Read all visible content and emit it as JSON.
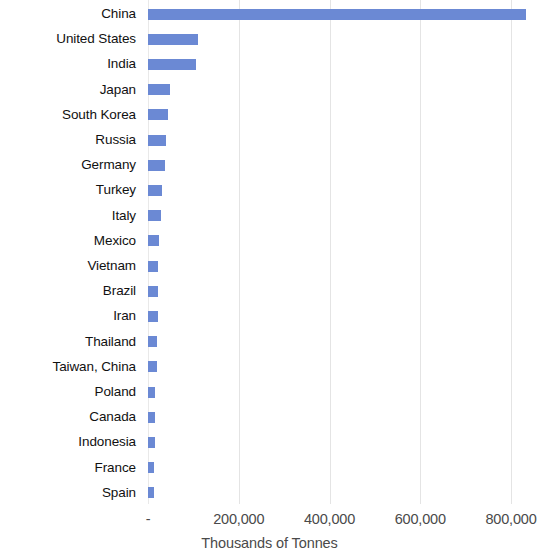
{
  "chart_data": {
    "type": "bar",
    "orientation": "horizontal",
    "title": "",
    "xlabel": "Thousands of Tonnes",
    "ylabel": "",
    "xlim": [
      0,
      840000
    ],
    "xticks": [
      0,
      200000,
      400000,
      600000,
      800000
    ],
    "xticklabels": [
      "-",
      "200,000",
      "400,000",
      "600,000",
      "800,000"
    ],
    "grid": "vertical",
    "legend": "none",
    "bar_color": "#6b89d4",
    "gridline_color": "#e4e4e4",
    "label_color": "#111111",
    "tick_color": "#4a4a4a",
    "categories": [
      "China",
      "United States",
      "India",
      "Japan",
      "South Korea",
      "Russia",
      "Germany",
      "Turkey",
      "Italy",
      "Mexico",
      "Vietnam",
      "Brazil",
      "Iran",
      "Thailand",
      "Taiwan, China",
      "Poland",
      "Canada",
      "Indonesia",
      "France",
      "Spain"
    ],
    "values": [
      833000,
      110000,
      106000,
      48000,
      44000,
      40000,
      37000,
      31000,
      29000,
      24000,
      23000,
      22000,
      21000,
      20000,
      19000,
      16000,
      15000,
      15000,
      14000,
      13000
    ]
  }
}
